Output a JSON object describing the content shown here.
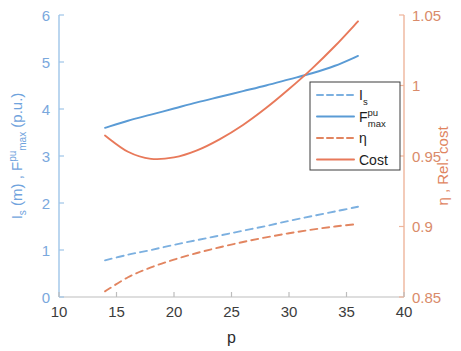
{
  "chart_data": {
    "type": "line",
    "title": "",
    "xlabel": "p",
    "ylabel_left": "I_s (m) , F^pu_max (p.u.)",
    "ylabel_right": "η , Rel. cost",
    "xlim": [
      10,
      40
    ],
    "ylim_left": [
      0,
      6
    ],
    "ylim_right": [
      0.85,
      1.05
    ],
    "xticks": [
      10,
      15,
      20,
      25,
      30,
      35,
      40
    ],
    "yticks_left": [
      0,
      1,
      2,
      3,
      4,
      5,
      6
    ],
    "yticks_right": [
      0.85,
      0.9,
      0.95,
      1,
      1.05
    ],
    "grid": false,
    "legend_position": "center-right",
    "x": [
      14,
      16,
      18,
      20,
      22,
      24,
      26,
      28,
      30,
      32,
      34,
      36
    ],
    "series": [
      {
        "name": "I_s",
        "legend_label": "I",
        "legend_sub": "s",
        "axis": "left",
        "style": "dashed",
        "color": "#7cb0e0",
        "values": [
          0.78,
          0.9,
          1.0,
          1.11,
          1.21,
          1.31,
          1.41,
          1.51,
          1.62,
          1.72,
          1.82,
          1.92
        ]
      },
      {
        "name": "F_max^pu",
        "legend_label": "F",
        "legend_sup": "pu",
        "legend_sub": "max",
        "axis": "left",
        "style": "solid",
        "color": "#5a9bd5",
        "values": [
          3.6,
          3.75,
          3.88,
          4.01,
          4.14,
          4.26,
          4.38,
          4.5,
          4.63,
          4.76,
          4.92,
          5.13
        ]
      },
      {
        "name": "eta",
        "legend_label": "η",
        "axis": "right",
        "style": "dashed",
        "color": "#e28560",
        "values": [
          0.854,
          0.864,
          0.871,
          0.8765,
          0.8812,
          0.8853,
          0.889,
          0.8923,
          0.8952,
          0.8978,
          0.9,
          0.9018
        ]
      },
      {
        "name": "Cost",
        "legend_label": "Cost",
        "axis": "right",
        "style": "solid",
        "color": "#e8795a",
        "values": [
          0.9645,
          0.953,
          0.948,
          0.949,
          0.954,
          0.962,
          0.972,
          0.984,
          0.9975,
          1.012,
          1.028,
          1.0455
        ]
      }
    ]
  },
  "axes": {
    "left_label_parts": {
      "i": "I",
      "s": "s",
      "m": " (m) , ",
      "f": "F",
      "pu": "pu",
      "max": "max",
      "pu_unit": " (p.u.)"
    },
    "right_label_parts": {
      "eta": "η",
      "rest": " , Rel. cost"
    }
  },
  "legend": {
    "items": [
      {
        "label": "I",
        "sub": "s",
        "sup": "",
        "style": "dashed",
        "color": "#7cb0e0",
        "name": "legend-item-is"
      },
      {
        "label": "F",
        "sub": "max",
        "sup": "pu",
        "style": "solid",
        "color": "#5a9bd5",
        "name": "legend-item-fmax"
      },
      {
        "label": "η",
        "sub": "",
        "sup": "",
        "style": "dashed",
        "color": "#e28560",
        "name": "legend-item-eta"
      },
      {
        "label": "Cost",
        "sub": "",
        "sup": "",
        "style": "solid",
        "color": "#e8795a",
        "name": "legend-item-cost"
      }
    ]
  },
  "colors": {
    "left_axis": "#9ec5e8",
    "right_axis": "#eeb59c",
    "x_axis": "#bdbdbd",
    "blue_dashed": "#7cb0e0",
    "blue_solid": "#5a9bd5",
    "orange_dashed": "#e28560",
    "orange_solid": "#e8795a",
    "background": "#ffffff"
  }
}
